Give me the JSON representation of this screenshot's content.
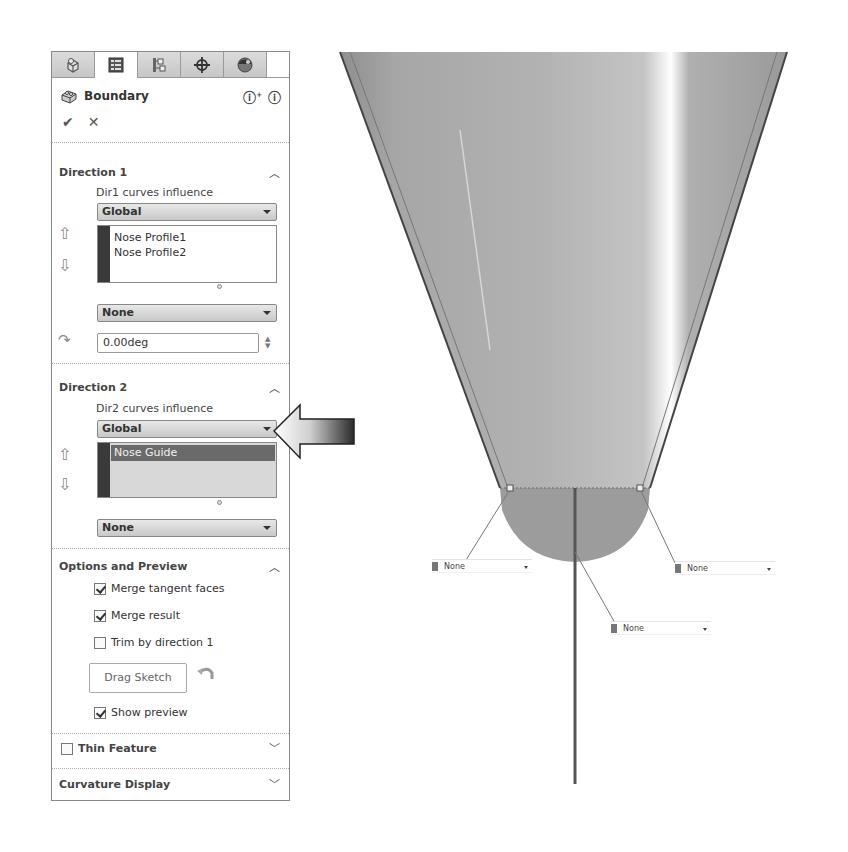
{
  "panel": {
    "tabs": [
      {
        "name": "feature-manager",
        "icon": "feature-tree-icon",
        "active": false
      },
      {
        "name": "property-manager",
        "icon": "property-manager-icon",
        "active": true
      },
      {
        "name": "configuration-manager",
        "icon": "configuration-icon",
        "active": false
      },
      {
        "name": "dimxpert-manager",
        "icon": "crosshair-icon",
        "active": false
      },
      {
        "name": "display-manager",
        "icon": "appearance-icon",
        "active": false
      }
    ],
    "title": "Boundary",
    "help_icons": [
      "?",
      "?"
    ],
    "ok_label": "✔",
    "cancel_label": "✕",
    "direction1": {
      "title": "Direction 1",
      "influence_label": "Dir1 curves influence",
      "influence_value": "Global",
      "curves": [
        "Nose Profile1",
        "Nose Profile2"
      ],
      "tangency_value": "None",
      "angle_value": "0.00deg"
    },
    "direction2": {
      "title": "Direction 2",
      "influence_label": "Dir2 curves influence",
      "influence_value": "Global",
      "curves": [
        "Nose Guide"
      ],
      "tangency_value": "None"
    },
    "options": {
      "title": "Options and Preview",
      "merge_tangent_faces": {
        "label": "Merge tangent faces",
        "checked": true
      },
      "merge_result": {
        "label": "Merge result",
        "checked": true
      },
      "trim_by_direction": {
        "label": "Trim by direction 1",
        "checked": false
      },
      "drag_sketch_label": "Drag Sketch",
      "show_preview": {
        "label": "Show preview",
        "checked": true
      }
    },
    "thin_feature": {
      "label": "Thin Feature",
      "checked": false
    },
    "curvature_display": {
      "label": "Curvature Display"
    }
  },
  "viewport": {
    "connector_combos": [
      {
        "value": "None"
      },
      {
        "value": "None"
      },
      {
        "value": "None"
      }
    ]
  }
}
